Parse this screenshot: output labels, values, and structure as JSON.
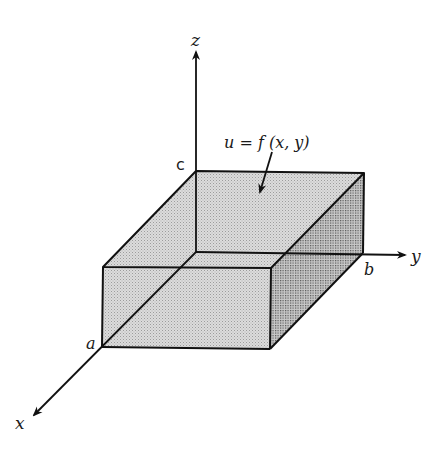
{
  "figure": {
    "type": "3d-box-diagram",
    "axes": {
      "x": "x",
      "y": "y",
      "z": "z"
    },
    "vertex_labels": {
      "a": "a",
      "b": "b",
      "c": "c"
    },
    "annotation": {
      "text": "u = f (x, y)",
      "points_to": "top-face"
    },
    "colors": {
      "line": "#111111",
      "face_top": "#d4d4d4",
      "face_front": "#cdcdcd",
      "face_right": "#9a9a9a",
      "background": "#ffffff"
    }
  }
}
